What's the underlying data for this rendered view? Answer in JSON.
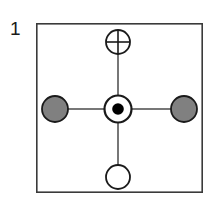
{
  "figure": {
    "label": "1",
    "caption_number": "1",
    "type": "node-link-diagram",
    "frame": {
      "name": "bounding-box",
      "x": 36,
      "y": 23,
      "width": 167,
      "height": 170,
      "stroke": "#3a3a3a",
      "stroke_width": 1.6,
      "fill": "#ffffff"
    },
    "edges": [
      {
        "name": "edge-center-top",
        "x1": 118,
        "y1": 54,
        "x2": 118,
        "y2": 95
      },
      {
        "name": "edge-center-bottom",
        "x1": 118,
        "y1": 122,
        "x2": 118,
        "y2": 165
      },
      {
        "name": "edge-center-left",
        "x1": 68,
        "y1": 109,
        "x2": 104,
        "y2": 109
      },
      {
        "name": "edge-center-right",
        "x1": 132,
        "y1": 109,
        "x2": 172,
        "y2": 109
      }
    ],
    "edge_style": {
      "stroke": "#4a4a4a",
      "stroke_width": 1.5
    },
    "nodes": [
      {
        "name": "node-top-crossed-circle",
        "position": "top",
        "symbol": "crossed-circle",
        "cx": 118,
        "cy": 42,
        "r": 12,
        "fill": "#ffffff",
        "stroke": "#1a1a1a",
        "stroke_width": 1.8
      },
      {
        "name": "node-left-filled-gray-circle",
        "position": "left",
        "symbol": "filled-circle",
        "cx": 55,
        "cy": 109,
        "r": 13,
        "fill": "#808080",
        "stroke": "#1a1a1a",
        "stroke_width": 1.8
      },
      {
        "name": "node-center-bullseye",
        "position": "center",
        "symbol": "bullseye",
        "cx": 118,
        "cy": 109,
        "r": 14,
        "inner_r": 6,
        "fill": "#ffffff",
        "inner_fill": "#000000",
        "stroke": "#1a1a1a",
        "stroke_width": 2.2
      },
      {
        "name": "node-right-filled-gray-circle",
        "position": "right",
        "symbol": "filled-circle",
        "cx": 184,
        "cy": 109,
        "r": 13,
        "fill": "#808080",
        "stroke": "#1a1a1a",
        "stroke_width": 1.8
      },
      {
        "name": "node-bottom-open-circle",
        "position": "bottom",
        "symbol": "open-circle",
        "cx": 118,
        "cy": 177,
        "r": 12,
        "fill": "#ffffff",
        "stroke": "#1a1a1a",
        "stroke_width": 1.8
      }
    ]
  }
}
